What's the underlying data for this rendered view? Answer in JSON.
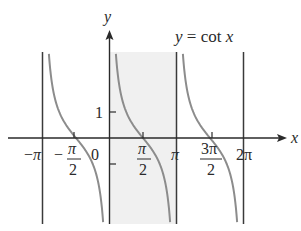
{
  "figure": {
    "title": "y = cot x",
    "equation_label": {
      "lhs": "y",
      "eq": " = cot ",
      "rhs": "x"
    },
    "axis_labels": {
      "x": "x",
      "y": "y"
    },
    "y_tick": {
      "value": 1,
      "label": "1"
    },
    "x_ticks": [
      {
        "value": -3.14159,
        "num": "−π",
        "den": ""
      },
      {
        "value": -1.5708,
        "num": "π",
        "den": "2",
        "sign": "−"
      },
      {
        "value": 0,
        "num": "0",
        "den": ""
      },
      {
        "value": 1.5708,
        "num": "π",
        "den": "2"
      },
      {
        "value": 3.14159,
        "num": "π",
        "den": ""
      },
      {
        "value": 4.71239,
        "num": "3π",
        "den": "2"
      },
      {
        "value": 6.28318,
        "num": "2π",
        "den": ""
      }
    ],
    "asymptotes": [
      "-π",
      "0",
      "π",
      "2π"
    ],
    "shaded_interval": {
      "from": "0",
      "to": "π",
      "color": "#f0f0f0"
    },
    "colors": {
      "curve": "#8c8c8c",
      "axes": "#2a2a2a",
      "asymptote": "#3a3a3a",
      "shade": "#f0f0f0"
    }
  },
  "chart_data": {
    "type": "line",
    "title": "y = cot x",
    "xlabel": "x",
    "ylabel": "y",
    "xlim": [
      -3.45,
      6.9
    ],
    "ylim": [
      -3.3,
      3.3
    ],
    "x_tick_labels": [
      "−π",
      "−π/2",
      "0",
      "π/2",
      "π",
      "3π/2",
      "2π"
    ],
    "y_tick_labels": [
      "1"
    ],
    "vertical_asymptotes": [
      -3.14159,
      0,
      3.14159,
      6.28318
    ],
    "series": [
      {
        "name": "cot x on (−π, 0)",
        "x": [
          -3.05,
          -2.8,
          -2.356,
          -1.571,
          -0.785,
          -0.34,
          -0.09
        ],
        "y": [
          -10.9,
          2.8,
          1,
          0,
          -1,
          -2.8,
          -11.1
        ]
      },
      {
        "name": "cot x on (0, π)",
        "x": [
          0.09,
          0.34,
          0.785,
          1.571,
          2.356,
          2.8,
          3.05
        ],
        "y": [
          11.1,
          2.8,
          1,
          0,
          -1,
          -2.8,
          -10.9
        ]
      },
      {
        "name": "cot x on (π, 2π)",
        "x": [
          3.23,
          3.48,
          3.927,
          4.712,
          5.498,
          5.94,
          6.19
        ],
        "y": [
          11.1,
          2.8,
          1,
          0,
          -1,
          -2.8,
          -10.9
        ]
      }
    ],
    "shaded_region": {
      "x_from": 0,
      "x_to": 3.14159
    },
    "grid": false,
    "legend": "none"
  }
}
